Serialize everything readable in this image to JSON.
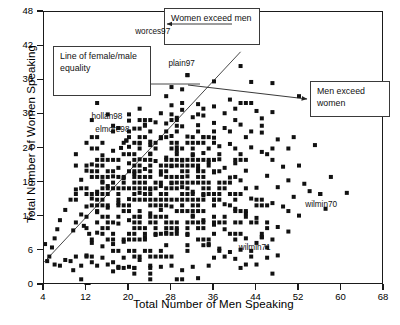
{
  "chart_data": {
    "type": "scatter",
    "title": "",
    "xlabel": "Total Number of Men Speaking",
    "ylabel": "Total Number of Women Speaking",
    "xlim": [
      4,
      68
    ],
    "ylim": [
      0,
      48
    ],
    "xticks": [
      4,
      12,
      20,
      28,
      36,
      44,
      52,
      60,
      68
    ],
    "yticks": [
      0,
      6,
      12,
      18,
      24,
      30,
      36,
      42,
      48
    ],
    "grid": false,
    "legend": "none",
    "marker": "filled-square",
    "marker_color": "#111111",
    "reference_line": {
      "name": "Line of female/male equality",
      "equation": "y = x",
      "x_start": 4,
      "y_start": 4,
      "x_end": 41,
      "y_end": 41,
      "color": "#333333"
    },
    "annotations": [
      {
        "name": "equality-callout",
        "text": "Line of female/male equality",
        "points_to": [
          12.5,
          12.5
        ]
      },
      {
        "name": "women-callout",
        "text": "Women exceed men",
        "points_to": [
          30,
          45
        ]
      },
      {
        "name": "men-callout",
        "text": "Men exceed women",
        "points_to": [
          24,
          29
        ]
      }
    ],
    "labeled_points": [
      {
        "label": "worces97",
        "x": 27,
        "y": 42.6
      },
      {
        "label": "plain97",
        "x": 31,
        "y": 36.9
      },
      {
        "label": "hollan98",
        "x": 18,
        "y": 27.6
      },
      {
        "label": "elmore98",
        "x": 19.5,
        "y": 25.4
      },
      {
        "label": "wilmin70",
        "x": 56,
        "y": 16
      },
      {
        "label": "wilmin71",
        "x": 45,
        "y": 8.4
      }
    ],
    "points": [
      [
        27,
        42.6
      ],
      [
        31,
        36.9
      ],
      [
        36,
        35.8
      ],
      [
        27,
        33.2
      ],
      [
        30,
        34.4
      ],
      [
        41,
        38.5
      ],
      [
        43,
        35.7
      ],
      [
        47,
        35.5
      ],
      [
        52,
        33.2
      ],
      [
        59,
        32.8
      ],
      [
        44,
        30.6
      ],
      [
        38,
        30.2
      ],
      [
        40,
        31.0
      ],
      [
        34,
        29.8
      ],
      [
        32,
        29.5
      ],
      [
        29,
        29.4
      ],
      [
        18,
        27.6
      ],
      [
        19.5,
        25.4
      ],
      [
        21,
        27.5
      ],
      [
        22,
        27.5
      ],
      [
        25,
        28.6
      ],
      [
        27,
        28.4
      ],
      [
        30,
        27.9
      ],
      [
        33,
        28.1
      ],
      [
        36,
        28.5
      ],
      [
        38,
        27.6
      ],
      [
        41,
        28.2
      ],
      [
        43,
        27.0
      ],
      [
        45,
        26.8
      ],
      [
        48,
        25.6
      ],
      [
        50,
        24.0
      ],
      [
        36,
        25.9
      ],
      [
        34,
        26.0
      ],
      [
        31,
        26.1
      ],
      [
        28,
        26.2
      ],
      [
        26,
        25.8
      ],
      [
        24,
        25.2
      ],
      [
        22,
        24.9
      ],
      [
        20,
        24.3
      ],
      [
        18.5,
        24.1
      ],
      [
        17,
        23.6
      ],
      [
        15,
        22.8
      ],
      [
        13,
        21.2
      ],
      [
        12,
        20.1
      ],
      [
        11,
        18.5
      ],
      [
        10,
        16.8
      ],
      [
        9,
        15.0
      ],
      [
        8,
        13.2
      ],
      [
        7,
        11.4
      ],
      [
        6.5,
        9.8
      ],
      [
        6,
        8.2
      ],
      [
        5.5,
        6.6
      ],
      [
        5,
        5.0
      ],
      [
        4.6,
        4.2
      ],
      [
        4.2,
        7.2
      ],
      [
        6,
        3.6
      ],
      [
        7,
        3.4
      ],
      [
        8,
        4.4
      ],
      [
        9,
        4.2
      ],
      [
        9.5,
        2.6
      ],
      [
        11,
        3.4
      ],
      [
        12,
        0
      ],
      [
        12.4,
        0
      ],
      [
        12,
        5.2
      ],
      [
        13,
        4.0
      ],
      [
        14,
        3.4
      ],
      [
        15,
        4.8
      ],
      [
        16,
        3.6
      ],
      [
        17,
        2.4
      ],
      [
        18,
        3.2
      ],
      [
        19,
        4.8
      ],
      [
        20,
        3.2
      ],
      [
        21,
        3.0
      ],
      [
        22,
        4.4
      ],
      [
        24,
        3.4
      ],
      [
        26,
        3.2
      ],
      [
        28,
        3.4
      ],
      [
        30,
        2.6
      ],
      [
        32,
        3.2
      ],
      [
        35,
        3.4
      ],
      [
        36,
        4.8
      ],
      [
        38,
        5.0
      ],
      [
        40,
        4.6
      ],
      [
        42,
        3.6
      ],
      [
        44,
        3.6
      ],
      [
        46,
        4.8
      ],
      [
        48,
        5.2
      ],
      [
        33,
        1.2
      ],
      [
        56,
        16
      ],
      [
        45,
        8.4
      ],
      [
        52,
        12.2
      ],
      [
        49,
        13.8
      ],
      [
        47,
        14.4
      ],
      [
        51,
        15.5
      ],
      [
        53,
        17.8
      ],
      [
        54,
        16.5
      ],
      [
        43,
        15.2
      ],
      [
        44,
        17.1
      ],
      [
        41,
        18.4
      ],
      [
        42,
        20.1
      ],
      [
        40,
        21.4
      ],
      [
        38,
        20.6
      ],
      [
        39,
        18.9
      ],
      [
        37,
        22.1
      ],
      [
        35,
        21.6
      ],
      [
        36,
        19.8
      ],
      [
        34,
        23.2
      ],
      [
        33,
        20.4
      ],
      [
        32,
        22.8
      ],
      [
        31,
        19.1
      ],
      [
        30,
        21.9
      ],
      [
        29,
        23.6
      ],
      [
        28,
        20.9
      ],
      [
        27,
        22.4
      ],
      [
        26,
        19.4
      ],
      [
        25,
        21.8
      ],
      [
        24,
        23.1
      ],
      [
        23,
        20.4
      ],
      [
        22,
        22.1
      ],
      [
        21,
        19.6
      ],
      [
        20,
        21.4
      ],
      [
        19,
        18.8
      ],
      [
        18,
        20.6
      ],
      [
        17,
        19.1
      ],
      [
        16,
        17.4
      ],
      [
        15,
        18.2
      ],
      [
        14,
        16.4
      ],
      [
        13,
        15.2
      ],
      [
        12,
        13.8
      ],
      [
        11,
        12.4
      ],
      [
        10,
        11.0
      ],
      [
        9.5,
        9.6
      ],
      [
        14,
        12.8
      ],
      [
        16,
        13.6
      ],
      [
        18,
        14.4
      ],
      [
        20,
        15.1
      ],
      [
        22,
        16.2
      ],
      [
        24,
        16.8
      ],
      [
        26,
        17.4
      ],
      [
        28,
        17.9
      ],
      [
        30,
        17.2
      ],
      [
        32,
        16.4
      ],
      [
        34,
        15.8
      ],
      [
        36,
        15.0
      ],
      [
        38,
        14.2
      ],
      [
        40,
        13.4
      ],
      [
        42,
        12.6
      ],
      [
        44,
        11.8
      ],
      [
        46,
        11.0
      ],
      [
        48,
        10.2
      ],
      [
        50,
        9.4
      ],
      [
        14,
        9.2
      ],
      [
        16,
        10.0
      ],
      [
        18,
        10.8
      ],
      [
        20,
        11.4
      ],
      [
        22,
        12.0
      ],
      [
        24,
        12.6
      ],
      [
        26,
        13.2
      ],
      [
        28,
        13.8
      ],
      [
        30,
        13.0
      ],
      [
        32,
        12.2
      ],
      [
        34,
        11.4
      ],
      [
        36,
        10.6
      ],
      [
        38,
        9.8
      ],
      [
        40,
        9.0
      ],
      [
        42,
        8.2
      ],
      [
        44,
        7.4
      ],
      [
        46,
        6.6
      ],
      [
        15,
        6.8
      ],
      [
        17,
        7.2
      ],
      [
        19,
        7.6
      ],
      [
        21,
        8.0
      ],
      [
        23,
        8.4
      ],
      [
        25,
        8.8
      ],
      [
        27,
        9.2
      ],
      [
        29,
        9.6
      ],
      [
        31,
        8.8
      ],
      [
        33,
        8.0
      ],
      [
        35,
        7.2
      ],
      [
        37,
        6.4
      ],
      [
        39,
        5.8
      ],
      [
        41,
        6.2
      ],
      [
        13,
        7.4
      ],
      [
        12.5,
        9.0
      ],
      [
        11.5,
        10.4
      ],
      [
        48,
        17.2
      ],
      [
        50,
        18.4
      ],
      [
        46,
        19.2
      ],
      [
        49,
        20.8
      ],
      [
        47,
        22.0
      ],
      [
        45,
        23.4
      ],
      [
        43,
        24.2
      ],
      [
        39,
        24.8
      ],
      [
        37,
        24.4
      ],
      [
        35,
        24.0
      ],
      [
        52,
        21.0
      ],
      [
        51,
        26.0
      ],
      [
        55,
        24.6
      ],
      [
        58,
        19.0
      ],
      [
        61,
        16.2
      ],
      [
        57,
        13.4
      ],
      [
        45,
        29.3
      ],
      [
        47,
        30.4
      ],
      [
        42,
        32.0
      ],
      [
        39,
        32.6
      ],
      [
        36,
        31.4
      ],
      [
        33,
        31.8
      ],
      [
        30,
        30.8
      ],
      [
        28,
        31.6
      ],
      [
        26,
        30.2
      ],
      [
        24,
        29.0
      ],
      [
        23,
        28.2
      ],
      [
        20,
        28.9
      ],
      [
        28,
        34.8
      ],
      [
        24,
        24.6
      ],
      [
        29,
        24.2
      ]
    ]
  },
  "axes": {
    "xlabel": "Total Number of Men Speaking",
    "ylabel": "Total Number of Women Speaking",
    "xticklabels": [
      "4",
      "12",
      "20",
      "28",
      "36",
      "44",
      "52",
      "60",
      "68"
    ],
    "yticklabels": [
      "0",
      "6",
      "12",
      "18",
      "24",
      "30",
      "36",
      "42",
      "48"
    ]
  },
  "callouts": {
    "equality": "Line of female/male equality",
    "women": "Women exceed men",
    "men": "Men exceed women"
  },
  "point_labels": {
    "worces97": "worces97",
    "plain97": "plain97",
    "hollan98": "hollan98",
    "elmore98": "elmore98",
    "wilmin70": "wilmin70",
    "wilmin71": "wilmin71"
  }
}
